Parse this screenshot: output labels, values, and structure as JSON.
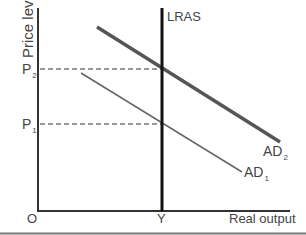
{
  "diagram": {
    "title": "",
    "y_axis_label": "Price level",
    "x_axis_label": "Real output",
    "origin_label": "O",
    "curves": [
      {
        "id": "LRAS",
        "label": "LRAS",
        "type": "vertical",
        "note": "long-run aggregate supply at Y"
      },
      {
        "id": "AD1",
        "label": "AD",
        "subscript": "1",
        "type": "downward-sloping"
      },
      {
        "id": "AD2",
        "label": "AD",
        "subscript": "2",
        "type": "downward-sloping",
        "note": "shifted right of AD1"
      }
    ],
    "price_levels": [
      {
        "label": "P",
        "subscript": "2"
      },
      {
        "label": "P",
        "subscript": "1"
      }
    ],
    "output_level": {
      "label": "Y"
    }
  },
  "colors": {
    "axis": "#333333",
    "lras": "#111111",
    "ad2": "#555555",
    "ad1": "#666666",
    "dashed": "#333333",
    "footer_rule": "#777777"
  }
}
